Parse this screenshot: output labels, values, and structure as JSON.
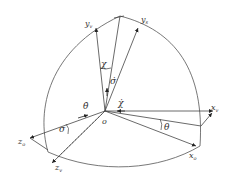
{
  "diagram": {
    "title": "",
    "colors": {
      "stroke": "#444444",
      "background": "#ffffff"
    },
    "origin": {
      "label": "o"
    },
    "axes": [
      {
        "id": "y_v",
        "label": "y",
        "subscript": "v"
      },
      {
        "id": "y_s",
        "label": "y",
        "subscript": "s"
      },
      {
        "id": "x_v",
        "label": "x",
        "subscript": "v"
      },
      {
        "id": "x_o",
        "label": "x",
        "subscript": "o"
      },
      {
        "id": "z_o",
        "label": "z",
        "subscript": "o"
      },
      {
        "id": "z_v",
        "label": "z",
        "subscript": "v"
      }
    ],
    "angles": [
      {
        "id": "chi",
        "label": "χ"
      },
      {
        "id": "sigma_dot",
        "label": "σ̇"
      },
      {
        "id": "theta_dot",
        "label": "θ̇"
      },
      {
        "id": "chi_dot",
        "label": "χ̇"
      },
      {
        "id": "sigma",
        "label": "σ"
      },
      {
        "id": "theta",
        "label": "θ"
      }
    ]
  }
}
